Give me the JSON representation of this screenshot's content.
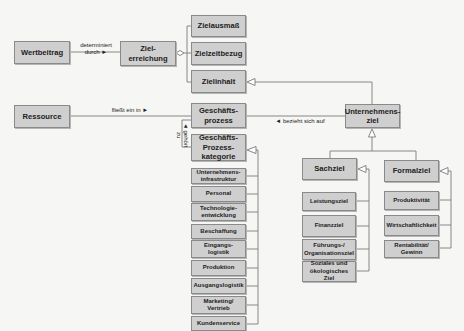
{
  "diagram": {
    "nodes": {
      "wertbeitrag": "Wertbeitrag",
      "zielerreichung": "Ziel-\nerreichung",
      "zielausmass": "Zielausmaß",
      "zielzeitbezug": "Zielzeitbezug",
      "zielinhalt": "Zielinhalt",
      "ressource": "Ressource",
      "geschaeftsprozess": "Geschäfts-\nprozess",
      "geschaeftsprozesskategorie": "Geschäfts-\nProzess-\nkategorie",
      "unternehmensziel": "Unternehmens-\nziel",
      "sachziel": "Sachziel",
      "formalziel": "Formalziel"
    },
    "process_categories": [
      "Unternehmens-\ninfrastruktur",
      "Personal",
      "Technologie-\nentwicklung",
      "Beschaffung",
      "Eingangs-\nlogistik",
      "Produktion",
      "Ausgangslogistik",
      "Marketing/\nVertrieb",
      "Kundenservice"
    ],
    "sachziel_children": [
      "Leistungsziel",
      "Finanzziel",
      "Führungs-/\nOrganisationsziel",
      "Soziales und\nökologisches Ziel"
    ],
    "formalziel_children": [
      "Produktivität",
      "Wirtschaftlichkeit",
      "Rentabilität/\nGewinn"
    ],
    "edge_labels": {
      "determiniert": "determiniert\ndurch ►",
      "fliesst": "fließt ein in ►",
      "gehoert": "◄ gehört\nzu",
      "bezieht": "◄ bezieht sich auf"
    },
    "colors": {
      "box_fill": "#cfcfcf",
      "box_border": "#8a8a8a",
      "line": "#7a7a7a",
      "background": "#f6f6f4"
    }
  }
}
